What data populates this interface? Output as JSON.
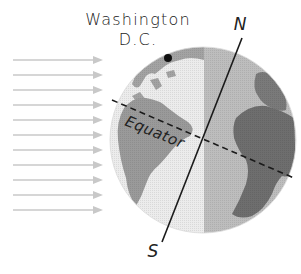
{
  "diagram": {
    "labels": {
      "city_line1": "Washington",
      "city_line2": "D.C.",
      "equator": "Equator",
      "north_pole": "N",
      "south_pole": "S"
    },
    "sun_rays": {
      "count": 11,
      "direction": "left-to-right",
      "color": "#c8c8c8"
    },
    "globe": {
      "day_side_color": "#ececec",
      "night_side_color": "#b9b9b9",
      "day_land_color": "#9a9a9a",
      "night_land_color": "#6e6e6e",
      "axis_color": "#1a1a1a",
      "equator_line": "dashed",
      "marker": "Washington D.C. dot"
    }
  }
}
